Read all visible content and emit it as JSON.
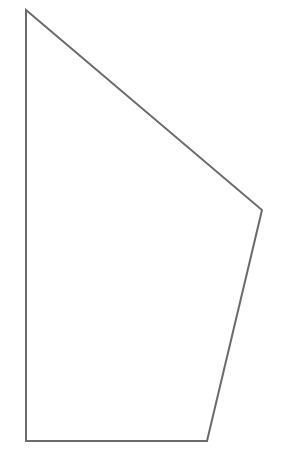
{
  "figure": {
    "shape": "quadrilateral",
    "vertices": [
      [
        26,
        10
      ],
      [
        262,
        210
      ],
      [
        207,
        441
      ],
      [
        26,
        441
      ]
    ],
    "stroke": "#6b6b6b",
    "stroke_width": 2,
    "fill": "none"
  }
}
